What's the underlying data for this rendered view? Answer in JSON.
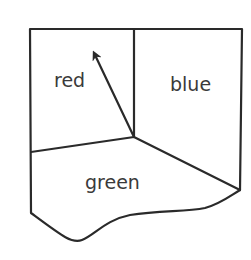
{
  "diagram": {
    "type": "region-map",
    "regions": [
      {
        "id": "red",
        "label": "red"
      },
      {
        "id": "blue",
        "label": "blue"
      },
      {
        "id": "green",
        "label": "green"
      }
    ],
    "arrow": {
      "from": "junction",
      "to": "red",
      "description": "arrow from the three-region junction pointing into red region"
    },
    "colors": {
      "line": "#2a2a2a",
      "text": "#3a3a3a",
      "background": "#ffffff"
    }
  }
}
